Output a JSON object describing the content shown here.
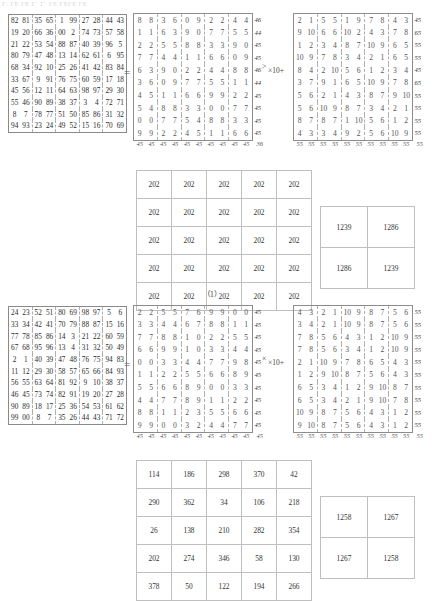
{
  "page": {
    "faint_header": "Γ: ΓΕ ΓΕ Γ· Γ· ΓΕ ΓΕΓΕ ΓΕ",
    "caption_1": "（1）",
    "equals_sign": "=",
    "times_symbol": "×",
    "times_ten_plus": "×10+",
    "gt_symbol": ">"
  },
  "block1": {
    "source_matrix": {
      "type": "table",
      "rows": [
        [
          "82",
          "81",
          "35",
          "65",
          "1",
          "99",
          "27",
          "28",
          "44",
          "43"
        ],
        [
          "19",
          "20",
          "66",
          "36",
          "00",
          "2",
          "74",
          "73",
          "57",
          "58"
        ],
        [
          "21",
          "22",
          "53",
          "54",
          "88",
          "87",
          "40",
          "39",
          "96",
          "5"
        ],
        [
          "80",
          "79",
          "47",
          "48",
          "13",
          "14",
          "62",
          "61",
          "6",
          "95"
        ],
        [
          "68",
          "34",
          "92",
          "10",
          "25",
          "26",
          "41",
          "42",
          "83",
          "84"
        ],
        [
          "33",
          "67",
          "9",
          "91",
          "76",
          "75",
          "60",
          "59",
          "17",
          "18"
        ],
        [
          "45",
          "56",
          "12",
          "11",
          "64",
          "63",
          "98",
          "97",
          "29",
          "30"
        ],
        [
          "55",
          "46",
          "90",
          "89",
          "38",
          "37",
          "3",
          "4",
          "72",
          "71"
        ],
        [
          "8",
          "7",
          "78",
          "77",
          "51",
          "50",
          "85",
          "86",
          "31",
          "32"
        ],
        [
          "94",
          "93",
          "23",
          "24",
          "49",
          "52",
          "15",
          "16",
          "70",
          "69"
        ]
      ]
    },
    "units_matrix": {
      "type": "table",
      "rows": [
        [
          "8",
          "8",
          "3",
          "6",
          "0",
          "9",
          "2",
          "2",
          "4",
          "4"
        ],
        [
          "1",
          "1",
          "6",
          "3",
          "9",
          "0",
          "7",
          "7",
          "5",
          "5"
        ],
        [
          "2",
          "2",
          "5",
          "5",
          "8",
          "8",
          "3",
          "3",
          "9",
          "0"
        ],
        [
          "7",
          "7",
          "4",
          "4",
          "1",
          "1",
          "6",
          "6",
          "0",
          "9"
        ],
        [
          "6",
          "3",
          "9",
          "0",
          "2",
          "2",
          "4",
          "4",
          "8",
          "8"
        ],
        [
          "3",
          "6",
          "0",
          "9",
          "7",
          "7",
          "5",
          "5",
          "1",
          "1"
        ],
        [
          "4",
          "5",
          "1",
          "1",
          "6",
          "6",
          "9",
          "9",
          "2",
          "2"
        ],
        [
          "5",
          "4",
          "8",
          "8",
          "3",
          "3",
          "0",
          "0",
          "7",
          "7"
        ],
        [
          "0",
          "0",
          "7",
          "7",
          "5",
          "4",
          "8",
          "8",
          "3",
          "3"
        ],
        [
          "9",
          "9",
          "2",
          "2",
          "4",
          "5",
          "1",
          "1",
          "6",
          "6"
        ]
      ],
      "row_sums": [
        "46",
        "44",
        "45",
        "45",
        "46",
        "44",
        "45",
        "45",
        "45",
        "45"
      ],
      "col_sums": [
        "45",
        "45",
        "45",
        "45",
        "45",
        "45",
        "45",
        "45",
        "45",
        "45"
      ],
      "corner_sum": "36"
    },
    "tens_matrix": {
      "type": "table",
      "rows": [
        [
          "2",
          "1",
          "5",
          "5",
          "1",
          "9",
          "7",
          "8",
          "4",
          "3"
        ],
        [
          "9",
          "10",
          "6",
          "6",
          "10",
          "2",
          "4",
          "3",
          "7",
          "8"
        ],
        [
          "1",
          "2",
          "3",
          "4",
          "8",
          "7",
          "10",
          "9",
          "6",
          "5"
        ],
        [
          "10",
          "9",
          "7",
          "8",
          "3",
          "4",
          "2",
          "1",
          "6",
          "5"
        ],
        [
          "8",
          "4",
          "2",
          "10",
          "5",
          "6",
          "1",
          "2",
          "3",
          "4"
        ],
        [
          "3",
          "7",
          "9",
          "1",
          "6",
          "5",
          "10",
          "9",
          "7",
          "8"
        ],
        [
          "5",
          "6",
          "2",
          "1",
          "4",
          "3",
          "8",
          "7",
          "9",
          "10"
        ],
        [
          "5",
          "6",
          "10",
          "9",
          "8",
          "7",
          "3",
          "4",
          "2",
          "1"
        ],
        [
          "8",
          "7",
          "8",
          "7",
          "1",
          "10",
          "5",
          "6",
          "1",
          "2"
        ],
        [
          "4",
          "3",
          "3",
          "4",
          "9",
          "2",
          "5",
          "6",
          "10",
          "9"
        ]
      ],
      "row_sums": [
        "45",
        "65",
        "55",
        "55",
        "45",
        "65",
        "55",
        "55",
        "55",
        "55"
      ],
      "col_sums": [
        "55",
        "55",
        "55",
        "55",
        "55",
        "55",
        "55",
        "55",
        "55",
        "55"
      ],
      "corner_sum": "55"
    },
    "constant_matrix": {
      "type": "table",
      "rows": [
        [
          "202",
          "202",
          "202",
          "202",
          "202"
        ],
        [
          "202",
          "202",
          "202",
          "202",
          "202"
        ],
        [
          "202",
          "202",
          "202",
          "202",
          "202"
        ],
        [
          "202",
          "202",
          "202",
          "202",
          "202"
        ],
        [
          "202",
          "202",
          "202",
          "202",
          "202"
        ]
      ]
    },
    "pair_matrix": {
      "type": "table",
      "rows": [
        [
          "1239",
          "1286"
        ],
        [
          "1286",
          "1239"
        ]
      ]
    }
  },
  "block2": {
    "source_matrix": {
      "type": "table",
      "rows": [
        [
          "24",
          "23",
          "52",
          "51",
          "80",
          "69",
          "98",
          "97",
          "5",
          "6"
        ],
        [
          "33",
          "34",
          "42",
          "41",
          "70",
          "79",
          "88",
          "87",
          "15",
          "16"
        ],
        [
          "77",
          "78",
          "85",
          "86",
          "14",
          "3",
          "21",
          "22",
          "60",
          "59"
        ],
        [
          "67",
          "68",
          "95",
          "96",
          "13",
          "4",
          "31",
          "32",
          "50",
          "49"
        ],
        [
          "2",
          "1",
          "40",
          "39",
          "47",
          "48",
          "76",
          "75",
          "94",
          "83"
        ],
        [
          "11",
          "12",
          "29",
          "30",
          "58",
          "57",
          "65",
          "66",
          "84",
          "93"
        ],
        [
          "56",
          "55",
          "63",
          "64",
          "81",
          "92",
          "9",
          "10",
          "38",
          "37"
        ],
        [
          "46",
          "45",
          "73",
          "74",
          "82",
          "91",
          "19",
          "20",
          "27",
          "28"
        ],
        [
          "90",
          "89",
          "18",
          "17",
          "25",
          "36",
          "54",
          "53",
          "61",
          "62"
        ],
        [
          "99",
          "00",
          "8",
          "7",
          "35",
          "26",
          "44",
          "43",
          "71",
          "72"
        ]
      ]
    },
    "units_matrix": {
      "type": "table",
      "rows": [
        [
          "2",
          "2",
          "5",
          "5",
          "7",
          "6",
          "9",
          "9",
          "0",
          "0"
        ],
        [
          "3",
          "3",
          "4",
          "4",
          "6",
          "7",
          "8",
          "8",
          "1",
          "1"
        ],
        [
          "7",
          "7",
          "8",
          "8",
          "1",
          "0",
          "2",
          "2",
          "5",
          "5"
        ],
        [
          "6",
          "6",
          "9",
          "9",
          "1",
          "0",
          "3",
          "3",
          "4",
          "4"
        ],
        [
          "0",
          "0",
          "3",
          "3",
          "4",
          "4",
          "7",
          "7",
          "9",
          "8"
        ],
        [
          "1",
          "1",
          "2",
          "2",
          "5",
          "5",
          "6",
          "6",
          "8",
          "9"
        ],
        [
          "5",
          "5",
          "6",
          "6",
          "8",
          "9",
          "0",
          "0",
          "3",
          "3"
        ],
        [
          "4",
          "4",
          "7",
          "7",
          "8",
          "9",
          "1",
          "1",
          "2",
          "2"
        ],
        [
          "8",
          "8",
          "1",
          "1",
          "2",
          "3",
          "5",
          "5",
          "6",
          "6"
        ],
        [
          "9",
          "9",
          "0",
          "0",
          "3",
          "2",
          "4",
          "4",
          "7",
          "7"
        ]
      ],
      "row_sums": [
        "45",
        "45",
        "45",
        "45",
        "45",
        "45",
        "45",
        "45",
        "45",
        "45"
      ],
      "col_sums": [
        "45",
        "45",
        "45",
        "45",
        "45",
        "45",
        "45",
        "45",
        "45",
        "45"
      ],
      "corner_sum": "45"
    },
    "tens_matrix": {
      "type": "table",
      "rows": [
        [
          "4",
          "3",
          "2",
          "1",
          "10",
          "9",
          "8",
          "7",
          "5",
          "6"
        ],
        [
          "3",
          "4",
          "2",
          "1",
          "10",
          "9",
          "8",
          "7",
          "5",
          "6"
        ],
        [
          "7",
          "8",
          "5",
          "6",
          "4",
          "3",
          "1",
          "2",
          "10",
          "9"
        ],
        [
          "7",
          "8",
          "5",
          "6",
          "3",
          "4",
          "1",
          "2",
          "10",
          "9"
        ],
        [
          "2",
          "1",
          "10",
          "9",
          "7",
          "8",
          "6",
          "5",
          "4",
          "3"
        ],
        [
          "1",
          "2",
          "9",
          "10",
          "8",
          "7",
          "5",
          "6",
          "4",
          "3"
        ],
        [
          "6",
          "5",
          "3",
          "4",
          "1",
          "2",
          "9",
          "10",
          "8",
          "7"
        ],
        [
          "6",
          "5",
          "3",
          "4",
          "2",
          "1",
          "9",
          "10",
          "7",
          "8"
        ],
        [
          "10",
          "9",
          "8",
          "7",
          "5",
          "6",
          "4",
          "3",
          "1",
          "2"
        ],
        [
          "9",
          "10",
          "8",
          "7",
          "5",
          "6",
          "4",
          "3",
          "1",
          "2"
        ]
      ],
      "row_sums": [
        "55",
        "55",
        "55",
        "55",
        "55",
        "55",
        "55",
        "55",
        "55",
        "55"
      ],
      "col_sums": [
        "55",
        "55",
        "55",
        "55",
        "55",
        "55",
        "55",
        "55",
        "55",
        "55"
      ],
      "corner_sum": "55"
    },
    "result_matrix": {
      "type": "table",
      "rows": [
        [
          "114",
          "186",
          "298",
          "370",
          "42"
        ],
        [
          "290",
          "362",
          "34",
          "106",
          "218"
        ],
        [
          "26",
          "138",
          "210",
          "282",
          "354"
        ],
        [
          "202",
          "274",
          "346",
          "58",
          "130"
        ],
        [
          "378",
          "50",
          "122",
          "194",
          "266"
        ]
      ]
    },
    "pair_matrix": {
      "type": "table",
      "rows": [
        [
          "1258",
          "1267"
        ],
        [
          "1267",
          "1258"
        ]
      ]
    }
  }
}
